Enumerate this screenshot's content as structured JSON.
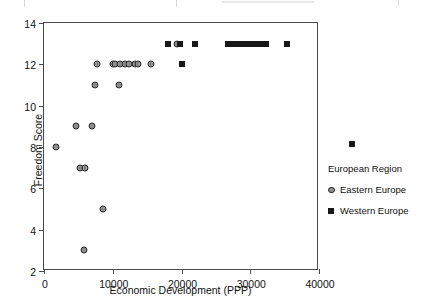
{
  "chart_data": {
    "type": "scatter",
    "title": "",
    "xlabel": "Economic Development (PPP)",
    "ylabel": "Freedom Score",
    "xlim": [
      0,
      40000
    ],
    "ylim": [
      2,
      14
    ],
    "xticks": [
      0,
      10000,
      20000,
      30000,
      40000
    ],
    "xtick_labels": [
      "0",
      "10000",
      "20000",
      "30000",
      "40000"
    ],
    "yticks": [
      2,
      4,
      6,
      8,
      10,
      12,
      14
    ],
    "ytick_labels": [
      "2",
      "4",
      "6",
      "8",
      "10",
      "12",
      "14"
    ],
    "grid": false,
    "legend_position": "right",
    "legend_title": "European Region",
    "series": [
      {
        "name": "Eastern Europe",
        "marker": "circle",
        "color": "#8d8d8d",
        "edge_color": "#2b2b2b",
        "points": [
          {
            "x": 1800,
            "y": 8
          },
          {
            "x": 4600,
            "y": 9
          },
          {
            "x": 5200,
            "y": 7
          },
          {
            "x": 5900,
            "y": 7
          },
          {
            "x": 5800,
            "y": 3
          },
          {
            "x": 7000,
            "y": 9
          },
          {
            "x": 7400,
            "y": 11
          },
          {
            "x": 7700,
            "y": 12
          },
          {
            "x": 8600,
            "y": 5
          },
          {
            "x": 10000,
            "y": 12
          },
          {
            "x": 10300,
            "y": 12
          },
          {
            "x": 10900,
            "y": 11
          },
          {
            "x": 11000,
            "y": 12
          },
          {
            "x": 11800,
            "y": 12
          },
          {
            "x": 12400,
            "y": 12
          },
          {
            "x": 13200,
            "y": 12
          },
          {
            "x": 13600,
            "y": 12
          },
          {
            "x": 15600,
            "y": 12
          },
          {
            "x": 19400,
            "y": 13
          }
        ]
      },
      {
        "name": "Western Europe",
        "marker": "square",
        "color": "#181818",
        "points": [
          {
            "x": 18000,
            "y": 13
          },
          {
            "x": 19800,
            "y": 13
          },
          {
            "x": 20000,
            "y": 12
          },
          {
            "x": 22000,
            "y": 13
          },
          {
            "x": 26700,
            "y": 13
          },
          {
            "x": 27300,
            "y": 13
          },
          {
            "x": 27900,
            "y": 13
          },
          {
            "x": 28500,
            "y": 13
          },
          {
            "x": 29100,
            "y": 13
          },
          {
            "x": 29700,
            "y": 13
          },
          {
            "x": 30300,
            "y": 13
          },
          {
            "x": 30800,
            "y": 13
          },
          {
            "x": 31500,
            "y": 13
          },
          {
            "x": 32300,
            "y": 13
          },
          {
            "x": 35300,
            "y": 13
          },
          {
            "x": 45000,
            "y": 8.1
          }
        ]
      }
    ]
  },
  "legend": {
    "title": "European Region",
    "entries": [
      {
        "label": "Eastern Europe",
        "key": "circle-marker-icon"
      },
      {
        "label": "Western Europe",
        "key": "square-marker-icon"
      }
    ]
  }
}
